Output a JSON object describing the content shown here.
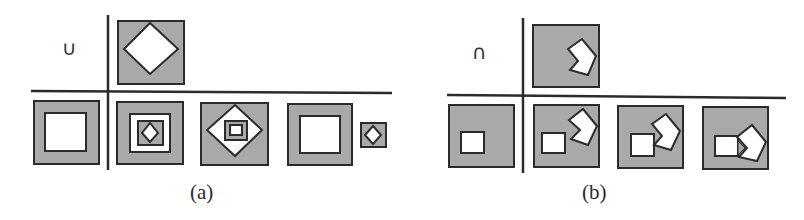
{
  "colors": {
    "gray_fill": "#a9a9a9",
    "stroke": "#2b2b2b",
    "white": "#ffffff"
  },
  "panel_a": {
    "operator_symbol": "∪",
    "operator_name": "union",
    "caption": "(a)",
    "structuring_element": "gray square containing white diamond",
    "operands": [
      "gray square with white square",
      "gray square with white square containing gray square with white diamond",
      "gray square with white diamond containing gray square with white square",
      "gray square with white square, plus small gray square with white diamond"
    ]
  },
  "panel_b": {
    "operator_symbol": "∩",
    "operator_name": "intersection",
    "caption": "(b)",
    "structuring_element": "gray square with white notched pentagon",
    "operands": [
      "gray square with small white square",
      "gray square with white square and white notched pentagon apart",
      "gray square with white square and white notched pentagon touching",
      "gray square with white square and white notched pentagon overlapping"
    ]
  }
}
